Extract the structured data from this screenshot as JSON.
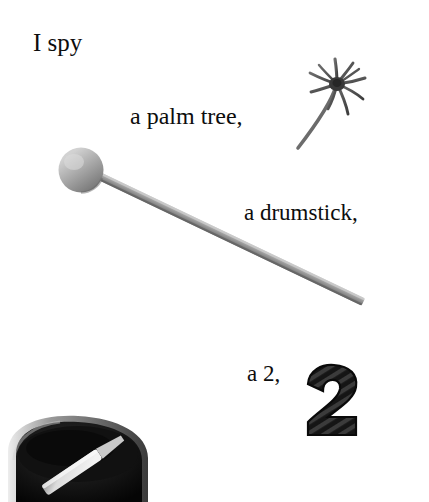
{
  "page": {
    "background_color": "#ffffff",
    "width": 429,
    "height": 502
  },
  "captions": {
    "intro": "I spy",
    "item1": "a palm tree,",
    "item2": "a drumstick,",
    "item3": "a 2,"
  },
  "objects": {
    "palm_tree": {
      "label": "palm tree",
      "description": "grayscale photo of a curved palm tree with spiky fronds",
      "color": "#5a5a5a"
    },
    "drumstick": {
      "label": "drumstick",
      "description": "gray mallet with round ball head and long tapered shaft",
      "color": "#9a9a9a"
    },
    "numeral_two": {
      "label": "2",
      "description": "thick black ribbed numeral two",
      "color": "#1a1a1a"
    },
    "paint_bucket": {
      "label": "paint bucket with palette knife",
      "description": "dark bucket of black paint with a light palette knife across it",
      "color": "#141414"
    }
  },
  "text_color": "#0d0d0d"
}
